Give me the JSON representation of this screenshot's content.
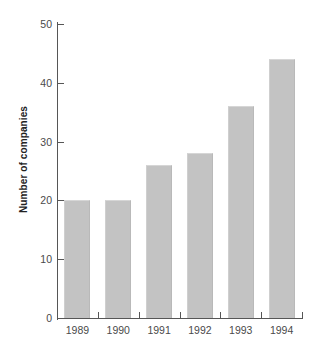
{
  "chart_data": {
    "type": "bar",
    "title": "",
    "subtitle": "",
    "xlabel": "",
    "ylabel": "Number of companies",
    "categories": [
      "1989",
      "1990",
      "1991",
      "1992",
      "1993",
      "1994"
    ],
    "values": [
      20,
      20,
      26,
      28,
      36,
      44
    ],
    "series": [
      {
        "name": "Number of companies",
        "values": [
          20,
          20,
          26,
          28,
          36,
          44
        ]
      }
    ],
    "ylim": [
      0,
      50
    ],
    "ytick_labels": [
      "0",
      "10",
      "20",
      "30",
      "40",
      "50"
    ],
    "ytick_values": [
      0,
      10,
      20,
      30,
      40,
      50
    ],
    "grid": false,
    "legend": false,
    "legend_position": "none",
    "annotations": [],
    "colors": {
      "bar_fill": "#c3c3c3",
      "axis": "#565656",
      "text": "#4a4a4a",
      "axis_title": "#222222",
      "background": "#ffffff"
    }
  }
}
